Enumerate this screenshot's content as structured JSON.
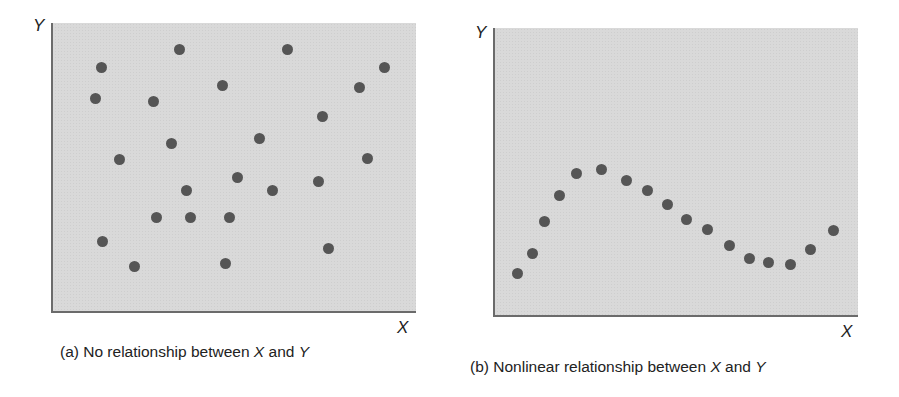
{
  "colors": {
    "panel_bg": "#d9d9d9",
    "dot": "#555555",
    "axis": "#6b6b6b"
  },
  "panels": [
    {
      "id": "a",
      "x_label": "X",
      "y_label": "Y",
      "caption_prefix": "(a) No relationship between ",
      "caption_x": "X",
      "caption_and": " and ",
      "caption_y": "Y"
    },
    {
      "id": "b",
      "x_label": "X",
      "y_label": "Y",
      "caption_prefix": "(b) Nonlinear relationship between ",
      "caption_x": "X",
      "caption_and": " and ",
      "caption_y": "Y"
    }
  ],
  "chart_data": [
    {
      "type": "scatter",
      "title": "(a) No relationship between X and Y",
      "xlabel": "X",
      "ylabel": "Y",
      "xlim": [
        0,
        100
      ],
      "ylim": [
        0,
        100
      ],
      "grid": false,
      "ticks": "none",
      "points": [
        {
          "x": 13.7,
          "y": 84.5
        },
        {
          "x": 35.1,
          "y": 91.0
        },
        {
          "x": 64.7,
          "y": 90.7
        },
        {
          "x": 91.5,
          "y": 84.8
        },
        {
          "x": 12.3,
          "y": 73.8
        },
        {
          "x": 28.2,
          "y": 73.1
        },
        {
          "x": 47.1,
          "y": 78.3
        },
        {
          "x": 84.4,
          "y": 77.9
        },
        {
          "x": 74.5,
          "y": 67.6
        },
        {
          "x": 32.9,
          "y": 58.6
        },
        {
          "x": 57.0,
          "y": 60.3
        },
        {
          "x": 18.9,
          "y": 52.8
        },
        {
          "x": 86.6,
          "y": 53.4
        },
        {
          "x": 51.2,
          "y": 46.6
        },
        {
          "x": 37.0,
          "y": 42.4
        },
        {
          "x": 60.8,
          "y": 42.4
        },
        {
          "x": 73.2,
          "y": 45.2
        },
        {
          "x": 29.0,
          "y": 32.8
        },
        {
          "x": 38.1,
          "y": 32.8
        },
        {
          "x": 48.8,
          "y": 33.1
        },
        {
          "x": 14.2,
          "y": 24.8
        },
        {
          "x": 75.9,
          "y": 22.4
        },
        {
          "x": 23.0,
          "y": 16.2
        },
        {
          "x": 47.7,
          "y": 16.9
        }
      ]
    },
    {
      "type": "scatter",
      "title": "(b) Nonlinear relationship between X and Y",
      "xlabel": "X",
      "ylabel": "Y",
      "xlim": [
        0,
        100
      ],
      "ylim": [
        0,
        100
      ],
      "grid": false,
      "ticks": "none",
      "points": [
        {
          "x": 6.8,
          "y": 14.9
        },
        {
          "x": 10.7,
          "y": 21.8
        },
        {
          "x": 14.2,
          "y": 33.2
        },
        {
          "x": 18.1,
          "y": 42.2
        },
        {
          "x": 23.0,
          "y": 49.8
        },
        {
          "x": 29.6,
          "y": 51.2
        },
        {
          "x": 36.7,
          "y": 47.4
        },
        {
          "x": 42.2,
          "y": 43.9
        },
        {
          "x": 47.9,
          "y": 39.1
        },
        {
          "x": 52.9,
          "y": 33.9
        },
        {
          "x": 58.9,
          "y": 30.4
        },
        {
          "x": 64.9,
          "y": 24.6
        },
        {
          "x": 70.4,
          "y": 20.1
        },
        {
          "x": 75.6,
          "y": 18.7
        },
        {
          "x": 81.6,
          "y": 18.3
        },
        {
          "x": 87.1,
          "y": 23.2
        },
        {
          "x": 93.4,
          "y": 29.8
        }
      ]
    }
  ]
}
